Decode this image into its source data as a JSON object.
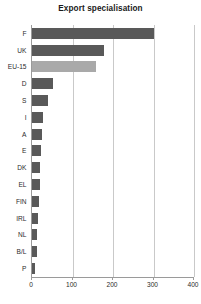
{
  "chart_data": {
    "type": "bar",
    "orientation": "horizontal",
    "title": "Export specialisation",
    "xlabel": "",
    "ylabel": "",
    "xlim": [
      0,
      400
    ],
    "ylim": null,
    "grid": true,
    "legend": null,
    "xticks": [
      0,
      100,
      200,
      300,
      400
    ],
    "xtick_labels": [
      "0",
      "100",
      "200",
      "300",
      "400"
    ],
    "categories": [
      "F",
      "UK",
      "EU-15",
      "D",
      "S",
      "I",
      "A",
      "E",
      "DK",
      "EL",
      "FIN",
      "IRL",
      "NL",
      "B/L",
      "P"
    ],
    "values": [
      300,
      178,
      159,
      52,
      40,
      27,
      25,
      22,
      20,
      19,
      17,
      15,
      13,
      12,
      7
    ],
    "bar_color": "#595959",
    "highlight_color": "#a9a9a9",
    "highlight_categories": [
      "EU-15"
    ]
  }
}
